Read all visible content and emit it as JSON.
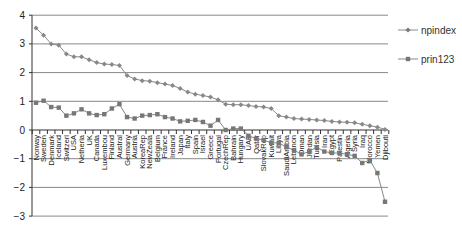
{
  "chart_data": {
    "type": "line",
    "title": "",
    "xlabel": "",
    "ylabel": "",
    "ylim": [
      -3,
      4
    ],
    "yticks": [
      4,
      3,
      2,
      1,
      0,
      -1,
      -2,
      -3
    ],
    "grid": true,
    "legend_position": "right",
    "categories": [
      "Norway",
      "Sweden",
      "Denmark",
      "Iceland",
      "Switzerl",
      "USA",
      "Netherla",
      "UK",
      "Canada",
      "Luxembou",
      "Finland",
      "Austral",
      "Germany",
      "Austria",
      "KoreaRep",
      "NewZeala",
      "Belgium",
      "France",
      "Ireland",
      "Japan",
      "Italy",
      "Spain",
      "Israel",
      "Greece",
      "Portugal",
      "CzechRep",
      "Bahrain",
      "Hungary",
      "UAE",
      "Qatar",
      "SlovakRep",
      "Kuwait",
      "Libya",
      "SaudiArabia",
      "Lebanon",
      "Oman",
      "Jordan",
      "Tunisia",
      "Iran",
      "Egypt",
      "Palestin",
      "Algeria",
      "Syria",
      "Iraq",
      "Morocco",
      "Yemen",
      "Djibouti"
    ],
    "series": [
      {
        "name": "npindex",
        "marker": "diamond",
        "color": "#888888",
        "values": [
          3.55,
          3.3,
          3.0,
          2.95,
          2.65,
          2.55,
          2.55,
          2.45,
          2.35,
          2.3,
          2.28,
          2.25,
          1.9,
          1.78,
          1.72,
          1.7,
          1.65,
          1.6,
          1.55,
          1.45,
          1.32,
          1.25,
          1.2,
          1.15,
          1.05,
          0.9,
          0.88,
          0.88,
          0.85,
          0.82,
          0.8,
          0.75,
          0.5,
          0.45,
          0.4,
          0.38,
          0.37,
          0.35,
          0.33,
          0.3,
          0.28,
          0.27,
          0.25,
          0.2,
          0.15,
          0.1,
          0.02
        ]
      },
      {
        "name": "prin123",
        "marker": "square",
        "color": "#777777",
        "values": [
          0.95,
          1.02,
          0.8,
          0.78,
          0.5,
          0.58,
          0.72,
          0.58,
          0.52,
          0.55,
          0.75,
          0.9,
          0.45,
          0.4,
          0.5,
          0.52,
          0.55,
          0.45,
          0.4,
          0.3,
          0.32,
          0.35,
          0.28,
          0.15,
          0.35,
          0.0,
          0.05,
          0.05,
          -0.2,
          -0.3,
          -0.35,
          -0.45,
          -0.45,
          -0.6,
          -0.7,
          -0.85,
          -0.75,
          -0.6,
          -0.75,
          -0.8,
          -0.8,
          -0.85,
          -0.9,
          -1.15,
          -1.05,
          -1.5,
          -2.5
        ]
      }
    ]
  },
  "legend": {
    "items": [
      {
        "label": "npindex"
      },
      {
        "label": "prin123"
      }
    ]
  }
}
